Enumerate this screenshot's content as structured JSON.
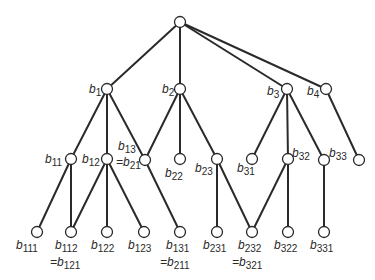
{
  "diagram": {
    "type": "tree",
    "colors": {
      "line": "#2a2a2a",
      "node_fill": "#ffffff",
      "background": "#ffffff"
    },
    "nodes": [
      {
        "id": "root",
        "x": 180,
        "y": 22,
        "label": "",
        "sub": ""
      },
      {
        "id": "b1",
        "x": 107,
        "y": 89,
        "label": "b",
        "sub": "1",
        "lx": 89,
        "ly": 93
      },
      {
        "id": "b2",
        "x": 180,
        "y": 89,
        "label": "b",
        "sub": "2",
        "lx": 162,
        "ly": 93
      },
      {
        "id": "b3",
        "x": 287,
        "y": 89,
        "label": "b",
        "sub": "3",
        "lx": 267,
        "ly": 95
      },
      {
        "id": "b4",
        "x": 326,
        "y": 89,
        "label": "b",
        "sub": "4",
        "lx": 307,
        "ly": 95
      },
      {
        "id": "b11",
        "x": 71,
        "y": 159,
        "label": "b",
        "sub": "11",
        "lx": 45,
        "ly": 163
      },
      {
        "id": "b12",
        "x": 107,
        "y": 159,
        "label": "b",
        "sub": "12",
        "lx": 82,
        "ly": 163
      },
      {
        "id": "b13",
        "x": 145,
        "y": 160,
        "label": "b",
        "sub": "13",
        "lx": 118,
        "ly": 150,
        "alt": "=b",
        "alt_sub": "21",
        "alx": 116,
        "aly": 166
      },
      {
        "id": "b22",
        "x": 180,
        "y": 159,
        "label": "b",
        "sub": "22",
        "lx": 165,
        "ly": 177
      },
      {
        "id": "b23",
        "x": 217,
        "y": 159,
        "label": "b",
        "sub": "23",
        "lx": 195,
        "ly": 172
      },
      {
        "id": "b31",
        "x": 252,
        "y": 159,
        "label": "b",
        "sub": "31",
        "lx": 237,
        "ly": 172
      },
      {
        "id": "b32",
        "x": 288,
        "y": 159,
        "label": "b",
        "sub": "32",
        "lx": 292,
        "ly": 157
      },
      {
        "id": "b33",
        "x": 324,
        "y": 160,
        "label": "b",
        "sub": "33",
        "lx": 329,
        "ly": 157
      },
      {
        "id": "b41",
        "x": 359,
        "y": 160,
        "label": "",
        "sub": ""
      },
      {
        "id": "b111",
        "x": 37,
        "y": 232,
        "label": "b",
        "sub": "111",
        "lx": 16,
        "ly": 249
      },
      {
        "id": "b112",
        "x": 71,
        "y": 232,
        "label": "b",
        "sub": "112",
        "lx": 55,
        "ly": 249,
        "alt": "=b",
        "alt_sub": "121",
        "alx": 50,
        "aly": 266
      },
      {
        "id": "b122",
        "x": 107,
        "y": 232,
        "label": "b",
        "sub": "122",
        "lx": 91,
        "ly": 249
      },
      {
        "id": "b123",
        "x": 144,
        "y": 232,
        "label": "b",
        "sub": "123",
        "lx": 128,
        "ly": 249
      },
      {
        "id": "b131",
        "x": 180,
        "y": 232,
        "label": "b",
        "sub": "131",
        "lx": 166,
        "ly": 249,
        "alt": "=b",
        "alt_sub": "211",
        "alx": 160,
        "aly": 266
      },
      {
        "id": "b231",
        "x": 217,
        "y": 232,
        "label": "b",
        "sub": "231",
        "lx": 203,
        "ly": 249
      },
      {
        "id": "b232",
        "x": 252,
        "y": 232,
        "label": "b",
        "sub": "232",
        "lx": 238,
        "ly": 249,
        "alt": "=b",
        "alt_sub": "321",
        "alx": 232,
        "aly": 266
      },
      {
        "id": "b322",
        "x": 288,
        "y": 232,
        "label": "b",
        "sub": "322",
        "lx": 274,
        "ly": 249
      },
      {
        "id": "b331",
        "x": 324,
        "y": 232,
        "label": "b",
        "sub": "331",
        "lx": 310,
        "ly": 249
      }
    ],
    "edges": [
      [
        "root",
        "b1"
      ],
      [
        "root",
        "b2"
      ],
      [
        "root",
        "b3"
      ],
      [
        "root",
        "b4"
      ],
      [
        "b1",
        "b11"
      ],
      [
        "b1",
        "b12"
      ],
      [
        "b1",
        "b13"
      ],
      [
        "b2",
        "b13"
      ],
      [
        "b2",
        "b22"
      ],
      [
        "b2",
        "b23"
      ],
      [
        "b3",
        "b31"
      ],
      [
        "b3",
        "b32"
      ],
      [
        "b3",
        "b33"
      ],
      [
        "b4",
        "b41"
      ],
      [
        "b11",
        "b111"
      ],
      [
        "b11",
        "b112"
      ],
      [
        "b12",
        "b112"
      ],
      [
        "b12",
        "b122"
      ],
      [
        "b12",
        "b123"
      ],
      [
        "b13",
        "b131"
      ],
      [
        "b23",
        "b231"
      ],
      [
        "b23",
        "b232"
      ],
      [
        "b32",
        "b232"
      ],
      [
        "b32",
        "b322"
      ],
      [
        "b33",
        "b331"
      ]
    ]
  }
}
